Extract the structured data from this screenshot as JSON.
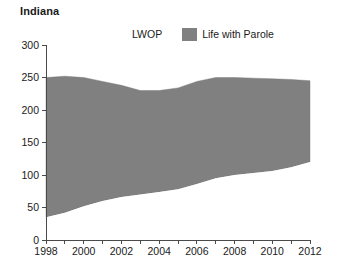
{
  "chart_data": {
    "type": "area",
    "stacked": true,
    "title": "Indiana",
    "xlabel": "",
    "ylabel": "",
    "xlim": [
      1998,
      2012
    ],
    "ylim": [
      0,
      300
    ],
    "ytick_values": [
      0,
      50,
      100,
      150,
      200,
      250,
      300
    ],
    "ytick_labels": [
      "0",
      "50",
      "100",
      "150",
      "200",
      "250",
      "300"
    ],
    "xtick_values": [
      1998,
      1999,
      2000,
      2001,
      2002,
      2003,
      2004,
      2005,
      2006,
      2007,
      2008,
      2009,
      2010,
      2011,
      2012
    ],
    "xtick_labels": [
      "1998",
      "",
      "2000",
      "",
      "2002",
      "",
      "2004",
      "",
      "2006",
      "",
      "2008",
      "",
      "2010",
      "",
      "2012"
    ],
    "xtick_labels_shown": [
      "1998",
      "2000",
      "2002",
      "2004",
      "2006",
      "2008",
      "2010",
      "2012"
    ],
    "grid": false,
    "legend_position": "top-center",
    "x": [
      1998,
      1999,
      2000,
      2001,
      2002,
      2003,
      2004,
      2005,
      2006,
      2007,
      2008,
      2009,
      2010,
      2011,
      2012
    ],
    "series": [
      {
        "name": "LWOP",
        "color": "#ffffff",
        "values": [
          35,
          42,
          52,
          60,
          66,
          70,
          74,
          78,
          86,
          95,
          100,
          103,
          106,
          112,
          120
        ]
      },
      {
        "name": "Life with Parole",
        "color": "#808080",
        "values": [
          215,
          210,
          198,
          184,
          172,
          160,
          156,
          156,
          158,
          155,
          150,
          146,
          142,
          135,
          125
        ]
      }
    ],
    "totals": [
      250,
      252,
      250,
      244,
      238,
      230,
      230,
      234,
      244,
      250,
      250,
      249,
      248,
      247,
      245
    ]
  },
  "legend": {
    "items": [
      {
        "label": "LWOP",
        "swatch": "white-swatch"
      },
      {
        "label": "Life with Parole",
        "swatch": "gray-swatch"
      }
    ]
  }
}
